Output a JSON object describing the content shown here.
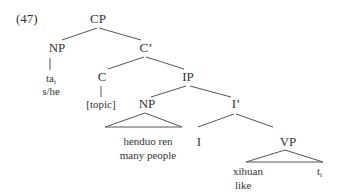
{
  "example_number": "(47)",
  "tree": {
    "cp": "CP",
    "np_subject": "NP",
    "c_bar": "C’",
    "ta": "ta",
    "ta_index": "i",
    "ta_gloss": "s/he",
    "c": "C",
    "ip": "IP",
    "topic": "[topic]",
    "np_object": "NP",
    "i_bar": "I’",
    "np_text": "henduo ren",
    "np_gloss": "many people",
    "i": "I",
    "vp": "VP",
    "verb": "xihuan",
    "verb_gloss": "like",
    "trace": "t",
    "trace_index": "i"
  }
}
